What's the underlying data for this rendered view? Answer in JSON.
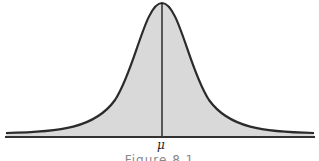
{
  "diagram": {
    "type": "normal-distribution-curve",
    "mean_label": "μ",
    "caption": "Figure 8.1",
    "fill_color": "#d9d9d9",
    "line_color": "#2b2b2b"
  }
}
